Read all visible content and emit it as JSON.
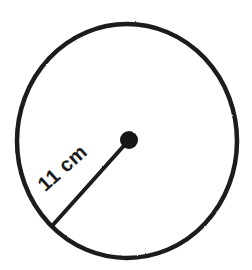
{
  "figure": {
    "kind": "geometry-diagram",
    "background_color": "#ffffff",
    "stroke_color": "#1a1a1a",
    "canvas": {
      "width": 252,
      "height": 270
    }
  },
  "circle": {
    "name": "circle-outline",
    "center_x": 127,
    "center_y": 141,
    "radius_x": 110,
    "radius_y": 117,
    "stroke_width": 4.5,
    "fill": "#ffffff",
    "stroke": "#1a1a1a"
  },
  "center_point": {
    "name": "center-dot",
    "x": 129,
    "y": 140,
    "radius": 9,
    "fill": "#151515"
  },
  "radius_segment": {
    "name": "radius-line",
    "from_x": 129,
    "from_y": 140,
    "to_x": 52,
    "to_y": 226,
    "stroke_width": 4,
    "stroke": "#1a1a1a"
  },
  "label": {
    "text": "11 cm",
    "value": "11",
    "unit": "cm",
    "rotation_deg": -42,
    "left": 41,
    "top": 176,
    "font_size": 20,
    "color": "#1a1a1a"
  }
}
